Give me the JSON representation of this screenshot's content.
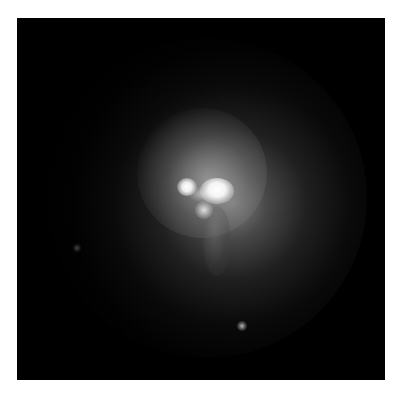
{
  "image": {
    "description": "Grayscale astronomical image of a galaxy with a bright double-lobed nucleus surrounded by a diffuse glowing halo on a black background",
    "background_color": "#000000",
    "page_color": "#ffffff",
    "features": [
      {
        "name": "diffuse-halo",
        "color": "#8a8a8a"
      },
      {
        "name": "bright-core-right",
        "color": "#ffffff"
      },
      {
        "name": "bright-core-left",
        "color": "#ffffff"
      },
      {
        "name": "faint-point-source-lower",
        "color": "#c8c8c8"
      },
      {
        "name": "faint-point-source-left",
        "color": "#6e6e6e"
      }
    ]
  },
  "caption": ""
}
